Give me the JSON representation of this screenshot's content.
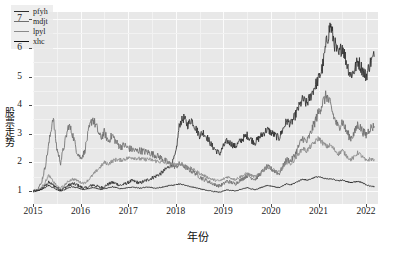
{
  "chart_data": {
    "type": "line",
    "title": "",
    "xlabel": "年份",
    "ylabel": "股票走势",
    "xlim": [
      2015.0,
      2022.25
    ],
    "ylim": [
      0.55,
      7.25
    ],
    "xticks": [
      "2015",
      "2016",
      "2017",
      "2018",
      "2019",
      "2020",
      "2021",
      "2022"
    ],
    "xtick_values": [
      2015,
      2016,
      2017,
      2018,
      2019,
      2020,
      2021,
      2022
    ],
    "yticks": [
      "1",
      "2",
      "3",
      "4",
      "5",
      "6",
      "7"
    ],
    "ytick_values": [
      1,
      2,
      3,
      4,
      5,
      6,
      7
    ],
    "grid": true,
    "grid_color": "#fbfbfb",
    "panel_background": "#e8e8e8",
    "legend_position": "upper left",
    "series": [
      {
        "name": "pfyh",
        "color": "#2f2f2f",
        "x": [
          2015.0,
          2015.08,
          2015.17,
          2015.25,
          2015.33,
          2015.42,
          2015.5,
          2015.58,
          2015.67,
          2015.75,
          2015.83,
          2015.92,
          2016.0,
          2016.08,
          2016.17,
          2016.25,
          2016.33,
          2016.42,
          2016.5,
          2016.58,
          2016.67,
          2016.75,
          2016.83,
          2016.92,
          2017.0,
          2017.08,
          2017.17,
          2017.25,
          2017.33,
          2017.42,
          2017.5,
          2017.58,
          2017.67,
          2017.75,
          2017.83,
          2017.92,
          2018.0,
          2018.08,
          2018.17,
          2018.25,
          2018.33,
          2018.42,
          2018.5,
          2018.58,
          2018.67,
          2018.75,
          2018.83,
          2018.92,
          2019.0,
          2019.08,
          2019.17,
          2019.25,
          2019.33,
          2019.42,
          2019.5,
          2019.58,
          2019.67,
          2019.75,
          2019.83,
          2019.92,
          2020.0,
          2020.08,
          2020.17,
          2020.25,
          2020.33,
          2020.42,
          2020.5,
          2020.58,
          2020.67,
          2020.75,
          2020.83,
          2020.92,
          2021.0,
          2021.08,
          2021.17,
          2021.25,
          2021.33,
          2021.42,
          2021.5,
          2021.58,
          2021.67,
          2021.75,
          2021.83,
          2021.92,
          2022.0,
          2022.08,
          2022.17
        ],
        "values": [
          1.0,
          1.02,
          1.08,
          1.18,
          1.3,
          1.22,
          1.12,
          1.05,
          1.12,
          1.2,
          1.26,
          1.22,
          1.15,
          1.1,
          1.14,
          1.22,
          1.18,
          1.12,
          1.16,
          1.24,
          1.3,
          1.26,
          1.2,
          1.24,
          1.3,
          1.36,
          1.32,
          1.28,
          1.34,
          1.4,
          1.46,
          1.52,
          1.6,
          1.7,
          1.82,
          1.95,
          2.3,
          3.35,
          3.55,
          3.3,
          3.5,
          3.2,
          2.95,
          3.05,
          2.85,
          2.6,
          2.45,
          2.3,
          2.55,
          2.75,
          2.65,
          2.55,
          2.7,
          2.85,
          2.95,
          2.8,
          2.7,
          2.85,
          3.0,
          3.15,
          3.05,
          2.95,
          2.85,
          3.15,
          3.45,
          3.35,
          3.6,
          3.9,
          4.2,
          4.05,
          4.3,
          4.65,
          4.9,
          5.3,
          6.2,
          6.8,
          6.2,
          5.7,
          6.1,
          5.55,
          5.05,
          5.2,
          5.55,
          5.25,
          5.0,
          5.45,
          5.7
        ]
      },
      {
        "name": "mdjt",
        "color": "#6f6f6f",
        "x": [
          2015.0,
          2015.08,
          2015.17,
          2015.25,
          2015.33,
          2015.42,
          2015.5,
          2015.58,
          2015.67,
          2015.75,
          2015.83,
          2015.92,
          2016.0,
          2016.08,
          2016.17,
          2016.25,
          2016.33,
          2016.42,
          2016.5,
          2016.58,
          2016.67,
          2016.75,
          2016.83,
          2016.92,
          2017.0,
          2017.08,
          2017.17,
          2017.25,
          2017.33,
          2017.42,
          2017.5,
          2017.58,
          2017.67,
          2017.75,
          2017.83,
          2017.92,
          2018.0,
          2018.08,
          2018.17,
          2018.25,
          2018.33,
          2018.42,
          2018.5,
          2018.58,
          2018.67,
          2018.75,
          2018.83,
          2018.92,
          2019.0,
          2019.08,
          2019.17,
          2019.25,
          2019.33,
          2019.42,
          2019.5,
          2019.58,
          2019.67,
          2019.75,
          2019.83,
          2019.92,
          2020.0,
          2020.08,
          2020.17,
          2020.25,
          2020.33,
          2020.42,
          2020.5,
          2020.58,
          2020.67,
          2020.75,
          2020.83,
          2020.92,
          2021.0,
          2021.08,
          2021.17,
          2021.25,
          2021.33,
          2021.42,
          2021.5,
          2021.58,
          2021.67,
          2021.75,
          2021.83,
          2021.92,
          2022.0,
          2022.08,
          2022.17
        ],
        "values": [
          1.0,
          1.05,
          1.25,
          1.8,
          2.6,
          3.6,
          2.5,
          2.0,
          2.7,
          3.3,
          3.0,
          2.4,
          2.15,
          2.35,
          3.1,
          3.55,
          3.25,
          2.85,
          3.05,
          2.75,
          2.95,
          2.7,
          2.55,
          2.6,
          2.5,
          2.45,
          2.4,
          2.42,
          2.38,
          2.35,
          2.3,
          2.25,
          2.18,
          2.1,
          2.0,
          1.9,
          1.85,
          1.95,
          1.88,
          1.78,
          1.7,
          1.62,
          1.5,
          1.42,
          1.35,
          1.28,
          1.22,
          1.18,
          1.25,
          1.35,
          1.3,
          1.25,
          1.35,
          1.45,
          1.55,
          1.48,
          1.42,
          1.55,
          1.7,
          1.85,
          1.78,
          1.7,
          1.6,
          1.85,
          2.1,
          2.05,
          2.25,
          2.55,
          2.85,
          2.7,
          3.0,
          3.4,
          3.75,
          4.05,
          4.35,
          4.0,
          3.55,
          3.2,
          3.45,
          3.1,
          2.85,
          3.0,
          3.35,
          3.1,
          2.95,
          3.2,
          3.25
        ]
      },
      {
        "name": "lpyl",
        "color": "#8a8a8a",
        "x": [
          2015.0,
          2015.08,
          2015.17,
          2015.25,
          2015.33,
          2015.42,
          2015.5,
          2015.58,
          2015.67,
          2015.75,
          2015.83,
          2015.92,
          2016.0,
          2016.08,
          2016.17,
          2016.25,
          2016.33,
          2016.42,
          2016.5,
          2016.58,
          2016.67,
          2016.75,
          2016.83,
          2016.92,
          2017.0,
          2017.08,
          2017.17,
          2017.25,
          2017.33,
          2017.42,
          2017.5,
          2017.58,
          2017.67,
          2017.75,
          2017.83,
          2017.92,
          2018.0,
          2018.08,
          2018.17,
          2018.25,
          2018.33,
          2018.42,
          2018.5,
          2018.58,
          2018.67,
          2018.75,
          2018.83,
          2018.92,
          2019.0,
          2019.08,
          2019.17,
          2019.25,
          2019.33,
          2019.42,
          2019.5,
          2019.58,
          2019.67,
          2019.75,
          2019.83,
          2019.92,
          2020.0,
          2020.08,
          2020.17,
          2020.25,
          2020.33,
          2020.42,
          2020.5,
          2020.58,
          2020.67,
          2020.75,
          2020.83,
          2020.92,
          2021.0,
          2021.08,
          2021.17,
          2021.25,
          2021.33,
          2021.42,
          2021.5,
          2021.58,
          2021.67,
          2021.75,
          2021.83,
          2021.92,
          2022.0,
          2022.08,
          2022.17
        ],
        "values": [
          1.0,
          1.02,
          1.1,
          1.3,
          1.55,
          1.35,
          1.18,
          1.1,
          1.22,
          1.35,
          1.42,
          1.38,
          1.3,
          1.28,
          1.4,
          1.55,
          1.7,
          1.85,
          2.0,
          1.95,
          2.05,
          2.1,
          2.08,
          2.12,
          2.15,
          2.18,
          2.15,
          2.12,
          2.1,
          2.12,
          2.08,
          2.05,
          2.02,
          2.0,
          1.98,
          1.95,
          1.92,
          1.95,
          1.9,
          1.85,
          1.78,
          1.7,
          1.62,
          1.55,
          1.48,
          1.42,
          1.38,
          1.35,
          1.42,
          1.5,
          1.45,
          1.4,
          1.48,
          1.55,
          1.62,
          1.55,
          1.5,
          1.6,
          1.72,
          1.85,
          1.8,
          1.72,
          1.65,
          1.82,
          2.0,
          1.95,
          2.1,
          2.3,
          2.5,
          2.4,
          2.55,
          2.7,
          2.85,
          2.7,
          2.55,
          2.6,
          2.45,
          2.3,
          2.42,
          2.25,
          2.1,
          2.18,
          2.35,
          2.2,
          2.05,
          2.12,
          2.1
        ]
      },
      {
        "name": "xhc",
        "color": "#111111",
        "x": [
          2015.0,
          2015.08,
          2015.17,
          2015.25,
          2015.33,
          2015.42,
          2015.5,
          2015.58,
          2015.67,
          2015.75,
          2015.83,
          2015.92,
          2016.0,
          2016.08,
          2016.17,
          2016.25,
          2016.33,
          2016.42,
          2016.5,
          2016.58,
          2016.67,
          2016.75,
          2016.83,
          2016.92,
          2017.0,
          2017.08,
          2017.17,
          2017.25,
          2017.33,
          2017.42,
          2017.5,
          2017.58,
          2017.67,
          2017.75,
          2017.83,
          2017.92,
          2018.0,
          2018.08,
          2018.17,
          2018.25,
          2018.33,
          2018.42,
          2018.5,
          2018.58,
          2018.67,
          2018.75,
          2018.83,
          2018.92,
          2019.0,
          2019.08,
          2019.17,
          2019.25,
          2019.33,
          2019.42,
          2019.5,
          2019.58,
          2019.67,
          2019.75,
          2019.83,
          2019.92,
          2020.0,
          2020.08,
          2020.17,
          2020.25,
          2020.33,
          2020.42,
          2020.5,
          2020.58,
          2020.67,
          2020.75,
          2020.83,
          2020.92,
          2021.0,
          2021.08,
          2021.17,
          2021.25,
          2021.33,
          2021.42,
          2021.5,
          2021.58,
          2021.67,
          2021.75,
          2021.83,
          2021.92,
          2022.0,
          2022.08,
          2022.17
        ],
        "values": [
          1.0,
          1.01,
          1.05,
          1.12,
          1.2,
          1.12,
          1.05,
          1.0,
          1.05,
          1.12,
          1.15,
          1.12,
          1.08,
          1.05,
          1.08,
          1.12,
          1.1,
          1.06,
          1.08,
          1.12,
          1.15,
          1.12,
          1.08,
          1.1,
          1.12,
          1.14,
          1.12,
          1.1,
          1.12,
          1.14,
          1.12,
          1.1,
          1.12,
          1.15,
          1.18,
          1.2,
          1.22,
          1.25,
          1.22,
          1.18,
          1.15,
          1.12,
          1.08,
          1.05,
          1.02,
          1.0,
          0.98,
          0.96,
          1.0,
          1.04,
          1.02,
          1.0,
          1.04,
          1.08,
          1.12,
          1.08,
          1.05,
          1.1,
          1.15,
          1.2,
          1.18,
          1.15,
          1.12,
          1.18,
          1.25,
          1.22,
          1.28,
          1.35,
          1.42,
          1.38,
          1.42,
          1.48,
          1.5,
          1.46,
          1.42,
          1.44,
          1.4,
          1.36,
          1.38,
          1.34,
          1.3,
          1.32,
          1.34,
          1.3,
          1.22,
          1.18,
          1.15
        ]
      }
    ]
  },
  "legend": {
    "items": [
      {
        "label": "pfyh"
      },
      {
        "label": "mdjt"
      },
      {
        "label": "lpyl"
      },
      {
        "label": "xhc"
      }
    ]
  }
}
